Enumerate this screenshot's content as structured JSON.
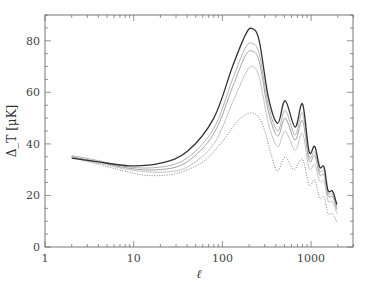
{
  "chart_data": {
    "type": "line",
    "title": "",
    "xlabel": "ℓ",
    "ylabel": "Δ_T [μK]",
    "xscale": "log",
    "xlim": [
      1,
      3000
    ],
    "ylim": [
      0,
      90
    ],
    "x_ticks": [
      1,
      10,
      100,
      1000
    ],
    "x_tick_labels": [
      "1",
      "10",
      "100",
      "1000"
    ],
    "y_ticks": [
      0,
      20,
      40,
      60,
      80
    ],
    "y_tick_labels": [
      "0",
      "20",
      "40",
      "60",
      "80"
    ],
    "grid": false,
    "legend": null,
    "series": [
      {
        "name": "curve-1",
        "style": "solid",
        "color": "#333333",
        "x": [
          2,
          4,
          9,
          20,
          40,
          80,
          130,
          180,
          215,
          260,
          330,
          420,
          510,
          660,
          800,
          950,
          1100,
          1250,
          1400,
          1550,
          1750,
          1950
        ],
        "values": [
          34.5,
          33.0,
          31.5,
          32.5,
          37.0,
          50.0,
          70.0,
          82.0,
          84.8,
          80.0,
          58.0,
          48.0,
          56.8,
          46.5,
          55.5,
          37.0,
          39.0,
          31.0,
          31.0,
          22.0,
          21.6,
          16.5
        ]
      },
      {
        "name": "curve-2",
        "style": "solid",
        "color": "#aaaaaa",
        "x": [
          2,
          4,
          9,
          20,
          40,
          80,
          130,
          180,
          215,
          260,
          330,
          420,
          510,
          660,
          800,
          950,
          1100,
          1250,
          1400,
          1550,
          1750,
          1950
        ],
        "values": [
          35.5,
          33.5,
          31.0,
          31.0,
          34.5,
          46.0,
          65.0,
          77.0,
          79.0,
          75.0,
          55.0,
          45.0,
          53.0,
          43.5,
          52.0,
          35.0,
          37.0,
          29.5,
          29.5,
          21.0,
          20.5,
          15.5
        ]
      },
      {
        "name": "curve-3",
        "style": "solid",
        "color": "#999999",
        "x": [
          2,
          4,
          9,
          20,
          40,
          80,
          130,
          180,
          215,
          260,
          330,
          420,
          510,
          660,
          800,
          950,
          1100,
          1250,
          1400,
          1550,
          1750,
          1950
        ],
        "values": [
          35.0,
          33.0,
          30.5,
          30.0,
          33.0,
          44.0,
          62.0,
          74.0,
          76.0,
          72.0,
          52.5,
          43.0,
          50.0,
          41.5,
          49.0,
          33.5,
          35.5,
          28.0,
          28.0,
          20.0,
          19.5,
          14.5
        ]
      },
      {
        "name": "curve-4",
        "style": "solid",
        "color": "#bbbbbb",
        "x": [
          2,
          4,
          9,
          20,
          40,
          80,
          130,
          180,
          215,
          260,
          330,
          420,
          510,
          660,
          800,
          950,
          1100,
          1250,
          1400,
          1550,
          1750,
          1950
        ],
        "values": [
          34.5,
          32.5,
          30.0,
          29.0,
          31.0,
          40.0,
          56.0,
          67.0,
          70.0,
          66.0,
          48.0,
          39.0,
          45.0,
          37.5,
          44.0,
          30.5,
          32.0,
          25.5,
          25.5,
          18.0,
          17.5,
          13.0
        ]
      },
      {
        "name": "curve-5",
        "style": "dotted",
        "color": "#777777",
        "x": [
          2,
          4,
          9,
          15,
          30,
          60,
          100,
          150,
          215,
          280,
          360,
          420,
          510,
          640,
          800,
          950,
          1100,
          1250,
          1400,
          1550,
          1750,
          1950
        ],
        "values": [
          35.0,
          32.0,
          29.0,
          27.7,
          28.5,
          33.0,
          41.0,
          49.0,
          52.0,
          48.0,
          35.0,
          29.5,
          35.0,
          30.0,
          34.0,
          24.0,
          26.0,
          19.0,
          19.5,
          13.0,
          13.0,
          9.5
        ]
      }
    ]
  }
}
